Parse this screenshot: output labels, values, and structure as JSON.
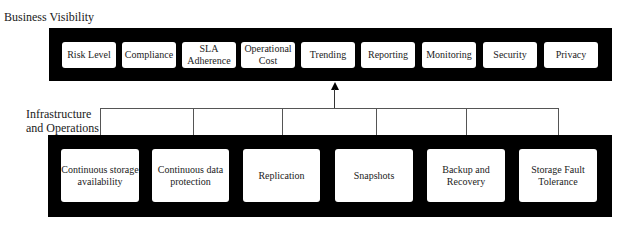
{
  "diagram": {
    "top_layer": {
      "title": "Business Visibility",
      "items": [
        {
          "label": "Risk Level"
        },
        {
          "label": "Compliance"
        },
        {
          "label": "SLA Adherence"
        },
        {
          "label": "Operational Cost"
        },
        {
          "label": "Trending"
        },
        {
          "label": "Reporting"
        },
        {
          "label": "Monitoring"
        },
        {
          "label": "Security"
        },
        {
          "label": "Privacy"
        }
      ]
    },
    "bottom_layer": {
      "title": "Infrastructure and Operations",
      "items": [
        {
          "label": "Continuous storage availability"
        },
        {
          "label": "Continuous data protection"
        },
        {
          "label": "Replication"
        },
        {
          "label": "Snapshots"
        },
        {
          "label": "Backup and Recovery"
        },
        {
          "label": "Storage Fault Tolerance"
        }
      ]
    },
    "connector": {
      "direction": "bottom-to-top",
      "arrow": "up"
    }
  }
}
